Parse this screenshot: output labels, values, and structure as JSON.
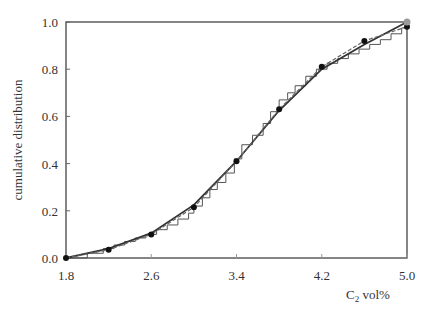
{
  "chart_data": {
    "type": "line",
    "title": "",
    "xlabel": "C2 vol%",
    "xlabel_main": "C",
    "xlabel_sub": "2",
    "xlabel_rest": " vol%",
    "ylabel": "cumulative distribution",
    "xlim": [
      1.8,
      5.0
    ],
    "ylim": [
      0.0,
      1.0
    ],
    "x_ticks": [
      "1.8",
      "2.6",
      "3.4",
      "4.2",
      "5.0"
    ],
    "y_ticks": [
      "0.0",
      "0.2",
      "0.4",
      "0.6",
      "0.8",
      "1.0"
    ],
    "grid": false,
    "legend": null,
    "series": [
      {
        "name": "empirical (step)",
        "style": "step",
        "x": [
          1.8,
          2.0,
          2.15,
          2.25,
          2.35,
          2.45,
          2.55,
          2.65,
          2.75,
          2.85,
          2.95,
          3.0,
          3.08,
          3.15,
          3.22,
          3.3,
          3.38,
          3.45,
          3.55,
          3.65,
          3.72,
          3.8,
          3.88,
          3.95,
          4.05,
          4.15,
          4.25,
          4.35,
          4.45,
          4.55,
          4.65,
          4.75,
          4.85,
          4.95
        ],
        "y": [
          0.0,
          0.02,
          0.04,
          0.055,
          0.07,
          0.085,
          0.1,
          0.12,
          0.14,
          0.165,
          0.19,
          0.22,
          0.255,
          0.29,
          0.32,
          0.36,
          0.42,
          0.48,
          0.52,
          0.57,
          0.62,
          0.67,
          0.7,
          0.73,
          0.77,
          0.8,
          0.825,
          0.845,
          0.865,
          0.885,
          0.905,
          0.925,
          0.95,
          0.975
        ]
      },
      {
        "name": "fitted (solid)",
        "style": "solid",
        "x": [
          1.8,
          2.2,
          2.6,
          3.0,
          3.4,
          3.8,
          4.2,
          4.6,
          5.0
        ],
        "y": [
          0.0,
          0.04,
          0.105,
          0.225,
          0.41,
          0.625,
          0.8,
          0.905,
          1.0
        ]
      },
      {
        "name": "data points (dashed)",
        "style": "dashed",
        "markers": true,
        "x": [
          1.8,
          2.2,
          2.6,
          3.0,
          3.4,
          3.8,
          4.2,
          4.6,
          5.0
        ],
        "y": [
          0.0,
          0.035,
          0.1,
          0.215,
          0.41,
          0.63,
          0.81,
          0.92,
          0.98
        ]
      }
    ],
    "annotations": [
      {
        "type": "grey-point",
        "x": 5.0,
        "y": 1.0
      }
    ]
  }
}
